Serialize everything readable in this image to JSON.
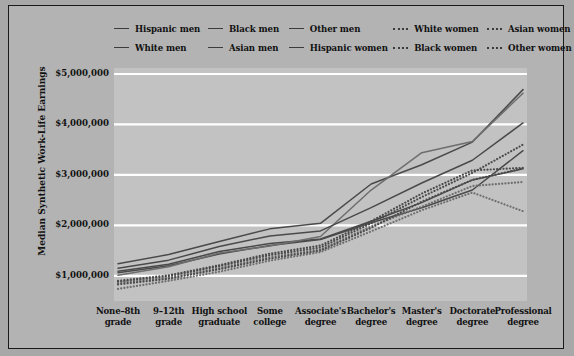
{
  "chart_data": {
    "type": "line",
    "title": "",
    "xlabel": "",
    "ylabel": "Median Synthetic Work-Life Earnings",
    "ylim": [
      500000,
      5000000
    ],
    "ytick_labels": [
      "$5,000,000",
      "$4,000,000",
      "$3,000,000",
      "$2,000,000",
      "$1,000,000"
    ],
    "ytick_values": [
      5000000,
      4000000,
      3000000,
      2000000,
      1000000
    ],
    "grid": true,
    "legend_position": "top",
    "categories": [
      "None–8th grade",
      "9–12th grade",
      "High school graduate",
      "Some college",
      "Associate's degree",
      "Bachelor's degree",
      "Master's degree",
      "Doctorate degree",
      "Professional degree"
    ],
    "category_lines": [
      [
        "None–8th",
        "grade"
      ],
      [
        "9–12th",
        "grade"
      ],
      [
        "High school",
        "graduate"
      ],
      [
        "Some",
        "college"
      ],
      [
        "Associate's",
        "degree"
      ],
      [
        "Bachelor's",
        "degree"
      ],
      [
        "Master's",
        "degree"
      ],
      [
        "Doctorate",
        "degree"
      ],
      [
        "Professional",
        "degree"
      ]
    ],
    "series": [
      {
        "name": "Hispanic men",
        "style": "solid",
        "color": "#4a4a4a",
        "values": [
          1060000,
          1200000,
          1430000,
          1600000,
          1720000,
          2050000,
          2350000,
          2700000,
          3480000
        ]
      },
      {
        "name": "White men",
        "style": "solid",
        "color": "#4a4a4a",
        "values": [
          1240000,
          1420000,
          1680000,
          1930000,
          2040000,
          2820000,
          3200000,
          3650000,
          4690000
        ]
      },
      {
        "name": "Black men",
        "style": "solid",
        "color": "#4a4a4a",
        "values": [
          1090000,
          1230000,
          1480000,
          1640000,
          1730000,
          2080000,
          2450000,
          2900000,
          3120000
        ]
      },
      {
        "name": "Asian men",
        "style": "solid",
        "color": "#6e6e6e",
        "values": [
          1010000,
          1180000,
          1450000,
          1590000,
          1780000,
          2700000,
          3440000,
          3660000,
          4620000
        ]
      },
      {
        "name": "Other men",
        "style": "solid",
        "color": "#4a4a4a",
        "values": [
          1150000,
          1310000,
          1580000,
          1790000,
          1890000,
          2350000,
          2840000,
          3290000,
          4030000
        ]
      },
      {
        "name": "White women",
        "style": "dotted",
        "color": "#4a4a4a",
        "values": [
          880000,
          990000,
          1190000,
          1410000,
          1560000,
          2040000,
          2560000,
          3040000,
          3600000
        ]
      },
      {
        "name": "Hispanic women",
        "style": "dotted",
        "color": "#6e6e6e",
        "values": [
          860000,
          960000,
          1150000,
          1370000,
          1520000,
          1980000,
          2370000,
          2780000,
          2860000
        ]
      },
      {
        "name": "Black women",
        "style": "dotted",
        "color": "#4a4a4a",
        "values": [
          830000,
          940000,
          1130000,
          1340000,
          1500000,
          1950000,
          2470000,
          2900000,
          3130000
        ]
      },
      {
        "name": "Asian women",
        "style": "dotted",
        "color": "#4a4a4a",
        "values": [
          900000,
          1010000,
          1210000,
          1440000,
          1600000,
          2080000,
          2630000,
          3090000,
          3140000
        ]
      },
      {
        "name": "Other women",
        "style": "dotted",
        "color": "#6e6e6e",
        "values": [
          740000,
          900000,
          1080000,
          1300000,
          1470000,
          1880000,
          2300000,
          2650000,
          2280000
        ]
      }
    ]
  },
  "legend": {
    "rows": [
      [
        {
          "label": "Hispanic men",
          "style": "solid"
        },
        {
          "label": "Black men",
          "style": "solid"
        },
        {
          "label": "Other men",
          "style": "solid"
        },
        {
          "label": "White women",
          "style": "dotted"
        },
        {
          "label": "Asian women",
          "style": "dotted"
        }
      ],
      [
        {
          "label": "White men",
          "style": "solid"
        },
        {
          "label": "Asian men",
          "style": "solid"
        },
        {
          "label": "Hispanic women",
          "style": "solid"
        },
        {
          "label": "Black women",
          "style": "dotted"
        },
        {
          "label": "Other women",
          "style": "dotted"
        }
      ]
    ]
  },
  "colors": {
    "page_background": "#a8a8a8",
    "panel_background": "#b3b3b3",
    "plot_background": "#c2c2c2",
    "gridline": "#ffffff",
    "line_dark": "#4a4a4a",
    "line_light": "#6e6e6e",
    "frame_border": "#1a1a1a",
    "text": "#111111"
  }
}
